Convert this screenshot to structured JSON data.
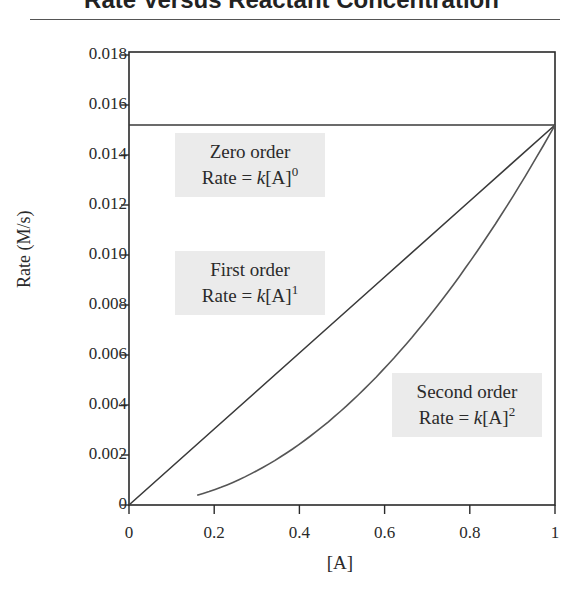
{
  "title": "Rate Versus Reactant Concentration",
  "chart_data": {
    "type": "line",
    "title": "Rate Versus Reactant Concentration",
    "xlabel": "[A]",
    "ylabel": "Rate (M/s)",
    "xlim": [
      0,
      1
    ],
    "ylim": [
      0,
      0.018
    ],
    "grid": false,
    "x_ticks": [
      "0",
      "0.2",
      "0.4",
      "0.6",
      "0.8",
      "1"
    ],
    "y_ticks": [
      "0",
      "0.002",
      "0.004",
      "0.006",
      "0.008",
      "0.010",
      "0.012",
      "0.014",
      "0.016",
      "0.018"
    ],
    "series": [
      {
        "name": "Zero order",
        "equation": "Rate = k[A]^0",
        "x": [
          0,
          1
        ],
        "y": [
          0.0152,
          0.0152
        ]
      },
      {
        "name": "First order",
        "equation": "Rate = k[A]^1",
        "x": [
          0,
          0.2,
          0.4,
          0.6,
          0.8,
          1.0
        ],
        "y": [
          0,
          0.00304,
          0.00608,
          0.00912,
          0.01216,
          0.0152
        ]
      },
      {
        "name": "Second order",
        "equation": "Rate = k[A]^2",
        "x": [
          0.16,
          0.2,
          0.4,
          0.6,
          0.8,
          1.0
        ],
        "y": [
          0.00039,
          0.00061,
          0.00243,
          0.00547,
          0.00973,
          0.0152
        ]
      }
    ],
    "annotations": [
      {
        "line1": "Zero order",
        "line2_prefix": "Rate = ",
        "k": "k",
        "bracket": "[A]",
        "exponent": "0"
      },
      {
        "line1": "First order",
        "line2_prefix": "Rate = ",
        "k": "k",
        "bracket": "[A]",
        "exponent": "1"
      },
      {
        "line1": "Second order",
        "line2_prefix": "Rate = ",
        "k": "k",
        "bracket": "[A]",
        "exponent": "2"
      }
    ],
    "legend": "inline-annotations"
  }
}
